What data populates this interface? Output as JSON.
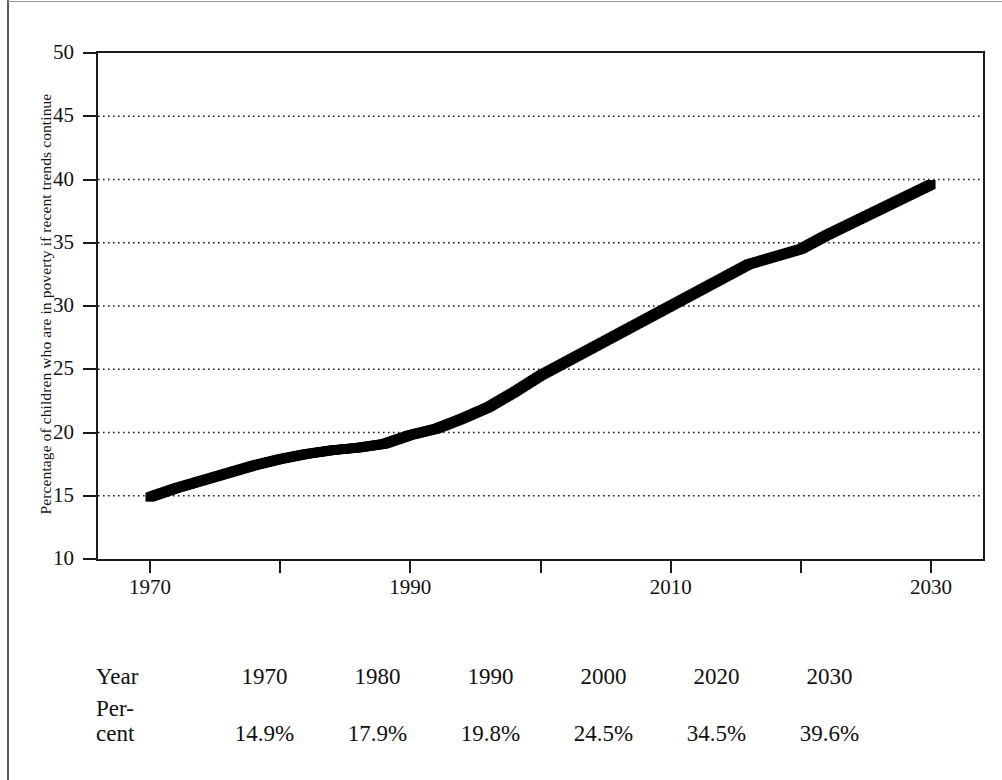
{
  "chart_data": {
    "type": "line",
    "title": "",
    "xlabel": "",
    "ylabel": "Percentage of children who are in poverty if recent trends continue",
    "xlim": [
      1966,
      2034
    ],
    "ylim": [
      10,
      50
    ],
    "y_ticks": [
      10,
      15,
      20,
      25,
      30,
      35,
      40,
      45,
      50
    ],
    "x_ticks": [
      1970,
      1980,
      1990,
      2000,
      2010,
      2020,
      2030
    ],
    "x_tick_labels": [
      "1970",
      "",
      "1990",
      "",
      "2010",
      "",
      "2030"
    ],
    "grid": "horizontal-dotted",
    "legend": "none",
    "marker": "filled-square-dense",
    "series": [
      {
        "name": "Percentage of children in poverty",
        "x": [
          1970,
          1972,
          1974,
          1976,
          1978,
          1980,
          1982,
          1984,
          1986,
          1988,
          1990,
          1992,
          1994,
          1996,
          1998,
          2000,
          2002,
          2004,
          2006,
          2008,
          2010,
          2012,
          2014,
          2016,
          2018,
          2020,
          2022,
          2024,
          2026,
          2028,
          2030
        ],
        "values": [
          14.9,
          15.6,
          16.2,
          16.8,
          17.4,
          17.9,
          18.3,
          18.6,
          18.8,
          19.1,
          19.8,
          20.3,
          21.1,
          22.0,
          23.2,
          24.5,
          25.6,
          26.7,
          27.8,
          28.9,
          30.0,
          31.1,
          32.2,
          33.3,
          33.9,
          34.5,
          35.6,
          36.6,
          37.6,
          38.6,
          39.6
        ]
      }
    ]
  },
  "y_axis": {
    "title": "Percentage of children who are in poverty if recent trends continue",
    "tick_labels": [
      "50",
      "45",
      "40",
      "35",
      "30",
      "25",
      "20",
      "15",
      "10"
    ]
  },
  "x_axis": {
    "tick_labels": [
      "1970",
      "1990",
      "2010",
      "2030"
    ]
  },
  "table": {
    "rows": [
      {
        "header": "Year",
        "cells": [
          "1970",
          "1980",
          "1990",
          "2000",
          "2020",
          "2030"
        ]
      },
      {
        "header": "Per-\ncent",
        "cells": [
          "14.9%",
          "17.9%",
          "19.8%",
          "24.5%",
          "34.5%",
          "39.6%"
        ]
      }
    ]
  }
}
